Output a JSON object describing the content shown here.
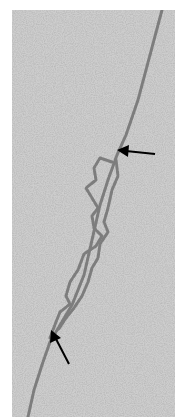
{
  "image": {
    "kind": "electron micrograph",
    "subject": "DNA strand with replication bubble / loop region",
    "background_color": "#c9c9c9",
    "strand_color": "#7a7a7a",
    "arrow_color": "#000000"
  },
  "annotations": [
    {
      "type": "arrow",
      "direction": "left",
      "tip_x": 117,
      "tip_y": 154
    },
    {
      "type": "arrow",
      "direction": "up-left",
      "tip_x": 51,
      "tip_y": 340
    }
  ]
}
